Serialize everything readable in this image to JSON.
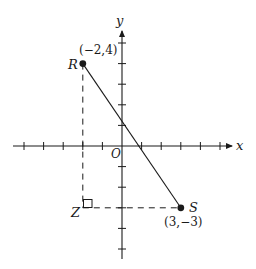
{
  "diagram": {
    "type": "coordinate-plane",
    "axes": {
      "x_label": "x",
      "y_label": "y",
      "origin_label": "O",
      "x_ticks": [
        -5,
        -4,
        -3,
        -2,
        -1,
        1,
        2,
        3,
        4,
        5
      ],
      "y_ticks": [
        -5,
        -4,
        -3,
        -2,
        -1,
        1,
        2,
        3,
        4,
        5
      ]
    },
    "points": {
      "R": {
        "label": "R",
        "coords_label": "(−2,4)",
        "x": -2,
        "y": 4
      },
      "S": {
        "label": "S",
        "coords_label": "(3,−3)",
        "x": 3,
        "y": -3
      },
      "Z": {
        "label": "Z",
        "x": -2,
        "y": -3
      }
    },
    "segments": [
      {
        "from": "R",
        "to": "S",
        "style": "solid"
      },
      {
        "from": "R",
        "to": "Z",
        "style": "dashed"
      },
      {
        "from": "Z",
        "to": "S",
        "style": "dashed"
      }
    ],
    "right_angle_marker": "Z",
    "colors": {
      "ink": "#1a1a1a",
      "background": "#ffffff"
    }
  }
}
